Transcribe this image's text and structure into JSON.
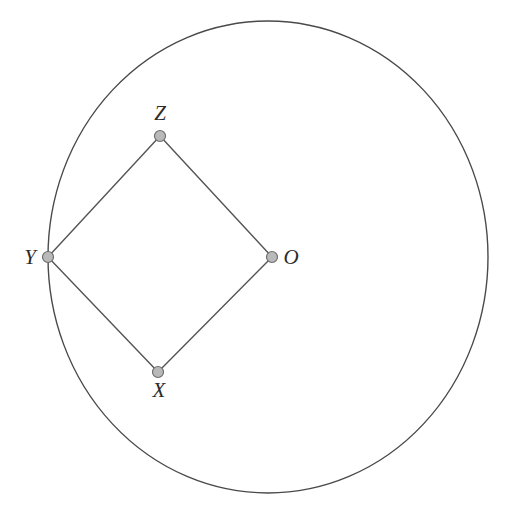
{
  "figure": {
    "canvas": {
      "width": 506,
      "height": 508,
      "background": "#ffffff"
    },
    "colors": {
      "circle_stroke": "#4a4a4a",
      "edge_stroke": "#555555",
      "node_fill": "#b9b9b9",
      "node_stroke": "#6e6e6e",
      "label_color": "#2b2b2b"
    },
    "circle": {
      "name": "circle-O",
      "center_x": 268,
      "center_y": 257,
      "radius_x": 220,
      "radius_y": 236,
      "stroke_width": 1.4,
      "fill": "none"
    },
    "points": [
      {
        "id": "Z",
        "label": "Z",
        "x": 160,
        "y": 136,
        "label_x": 160,
        "label_y": 120,
        "label_anchor": "middle",
        "on_circle": false
      },
      {
        "id": "Y",
        "label": "Y",
        "x": 48,
        "y": 257,
        "label_x": 30,
        "label_y": 264,
        "label_anchor": "middle",
        "on_circle": true
      },
      {
        "id": "O",
        "label": "O",
        "x": 272,
        "y": 257,
        "label_x": 291,
        "label_y": 264,
        "label_anchor": "middle",
        "on_circle": false
      },
      {
        "id": "X",
        "label": "X",
        "x": 158,
        "y": 372,
        "label_x": 159,
        "label_y": 397,
        "label_anchor": "middle",
        "on_circle": false
      }
    ],
    "node_radius": 5.5,
    "edges": [
      {
        "name": "edge-Y-Z",
        "from": "Y",
        "to": "Z"
      },
      {
        "name": "edge-Z-O",
        "from": "Z",
        "to": "O"
      },
      {
        "name": "edge-O-X",
        "from": "O",
        "to": "X"
      },
      {
        "name": "edge-X-Y",
        "from": "X",
        "to": "Y"
      }
    ]
  }
}
